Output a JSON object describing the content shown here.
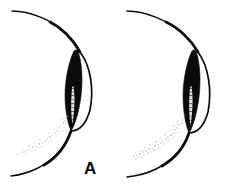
{
  "figure": {
    "background_color": "#ffffff",
    "ink_color": "#0b0b0b",
    "width": 234,
    "height": 186,
    "panel_count": 2
  },
  "panels": [
    {
      "id": "panel-a",
      "label": "A",
      "label_x": 84,
      "label_y": 160,
      "parts": {
        "globe_outline_name": "globe-outline",
        "cornea_arc_name": "cornea-arc",
        "slit_beam_name": "slit-beam",
        "highlight_streak_name": "highlight-streak",
        "stipple_band_name": "stipple-band"
      },
      "stipple": {
        "density": "light",
        "dot_count": 120,
        "color": "#c9c9c9"
      },
      "slit_beam": {
        "fill": "#0b0b0b",
        "top_y": 50,
        "bottom_y": 129,
        "max_width": 13
      }
    },
    {
      "id": "panel-b",
      "label": "B",
      "label_x": 199,
      "label_y": 160,
      "parts": {
        "globe_outline_name": "globe-outline",
        "cornea_arc_name": "cornea-arc",
        "slit_beam_name": "slit-beam",
        "highlight_streak_name": "highlight-streak",
        "stipple_band_name": "stipple-band"
      },
      "stipple": {
        "density": "medium",
        "dot_count": 170,
        "color": "#bdbdbd"
      },
      "slit_beam": {
        "fill": "#0b0b0b",
        "top_y": 50,
        "bottom_y": 131,
        "max_width": 14
      }
    }
  ],
  "geometry": {
    "globe_arc_path": "M 12,11 C 44,13 70,30 80,52",
    "globe_arc_lower_path": "M 71,131 C 62,152 42,168 11,175",
    "cornea_outer_path": "M 80,52 C 93,66 95,96 88,116 C 83,127 77,131 71,131",
    "cornea_inner_path": "M 79,53 C 88,70 90,95 84,113 C 80,124 75,129 70,130",
    "slit_beam_path": "M 78,52 C 82,62 82,80 80,96 C 78,112 74,124 70,130 C 67,124 65,112 65,96 C 65,80 69,62 74,52 C 75,51 77,51 78,52 Z",
    "highlight_path": "M 74,88 C 76,98 75,112 72,124 C 70,114 70,100 72,89 Z",
    "stipple_band_start": [
      16,
      154
    ],
    "stipple_band_end": [
      70,
      116
    ]
  },
  "colors": {
    "ink": "#0b0b0b",
    "paper": "#ffffff",
    "stipple_light": "#c9c9c9",
    "stipple_medium": "#bdbdbd",
    "highlight": "#f2f2f2"
  }
}
